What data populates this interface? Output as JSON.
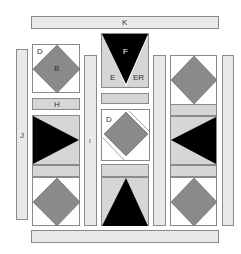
{
  "diagram": {
    "colors": {
      "strip": "#e9e9e9",
      "light": "#d6d6d6",
      "diamond": "#8a8a8a",
      "dark": "#000000",
      "border": "#8a8a8a"
    },
    "labels": {
      "top_strip": "K",
      "left_strip": "J",
      "sash_left": "I",
      "diamond_top_left_corner": "D",
      "diamond_top_left": "B",
      "strip_H": "H",
      "triangle_top": "F",
      "triangle_left_wedge": "E",
      "triangle_right_wedge": "ER",
      "rotated_block_corner": "D"
    }
  }
}
